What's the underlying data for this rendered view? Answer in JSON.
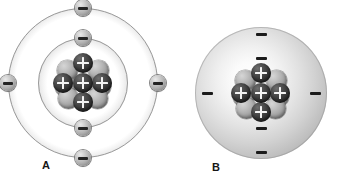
{
  "figure": {
    "background_color": "#ffffff",
    "width": 346,
    "height": 183
  },
  "panels": [
    {
      "id": "a",
      "label": "A",
      "model_name": "bohr-shell-model",
      "center": {
        "x": 83,
        "y": 83
      },
      "shells": [
        {
          "name": "inner-shell",
          "index": 1,
          "radius": 45,
          "electron_count": 2,
          "electrons": [
            {
              "name": "electron-inner-top",
              "x": 83,
              "y": 38,
              "charge": "-"
            },
            {
              "name": "electron-inner-bottom",
              "x": 83,
              "y": 128,
              "charge": "-"
            }
          ]
        },
        {
          "name": "outer-shell",
          "index": 2,
          "radius": 75,
          "electron_count": 4,
          "electrons": [
            {
              "name": "electron-outer-top",
              "x": 83,
              "y": 8,
              "charge": "-"
            },
            {
              "name": "electron-outer-right",
              "x": 158,
              "y": 83,
              "charge": "-"
            },
            {
              "name": "electron-outer-bottom",
              "x": 83,
              "y": 158,
              "charge": "-"
            },
            {
              "name": "electron-outer-left",
              "x": 8,
              "y": 83,
              "charge": "-"
            }
          ]
        }
      ],
      "total_electrons": 6
    },
    {
      "id": "b",
      "label": "B",
      "model_name": "electron-cloud-model",
      "center": {
        "x": 88,
        "y": 93
      },
      "cloud": {
        "name": "electron-cloud",
        "radius": 66,
        "fill": "radial-gray-gradient"
      },
      "electron_marks": [
        {
          "name": "electron-mark-top-outer",
          "x": 88,
          "y": 34,
          "charge": "-"
        },
        {
          "name": "electron-mark-top-inner",
          "x": 88,
          "y": 58,
          "charge": "-"
        },
        {
          "name": "electron-mark-left",
          "x": 34,
          "y": 93,
          "charge": "-"
        },
        {
          "name": "electron-mark-right",
          "x": 142,
          "y": 93,
          "charge": "-"
        },
        {
          "name": "electron-mark-bottom-inner",
          "x": 88,
          "y": 128,
          "charge": "-"
        },
        {
          "name": "electron-mark-bottom-outer",
          "x": 88,
          "y": 152,
          "charge": "-"
        }
      ],
      "total_electrons": 6
    }
  ],
  "nucleus": {
    "name": "atomic-nucleus",
    "proton_count": 5,
    "neutron_count": 6,
    "proton_symbol": "+",
    "proton_color": "#2f2f2f",
    "neutron_color": "#aaaaaa",
    "protons": [
      {
        "name": "proton-top",
        "x": 19,
        "y": -1
      },
      {
        "name": "proton-left",
        "x": -1,
        "y": 19
      },
      {
        "name": "proton-center",
        "x": 19,
        "y": 19
      },
      {
        "name": "proton-right",
        "x": 38,
        "y": 19
      },
      {
        "name": "proton-bottom",
        "x": 19,
        "y": 38
      }
    ],
    "neutrons": [
      {
        "name": "neutron-top-left",
        "x": 3,
        "y": 6
      },
      {
        "name": "neutron-top-right",
        "x": 34,
        "y": 6
      },
      {
        "name": "neutron-mid-left",
        "x": 1,
        "y": 22
      },
      {
        "name": "neutron-mid-right",
        "x": 36,
        "y": 22
      },
      {
        "name": "neutron-bottom-left",
        "x": 4,
        "y": 34
      },
      {
        "name": "neutron-bottom-right",
        "x": 33,
        "y": 34
      }
    ]
  },
  "legend": {
    "electron_charge": "-",
    "proton_charge": "+",
    "neutron_charge": ""
  }
}
